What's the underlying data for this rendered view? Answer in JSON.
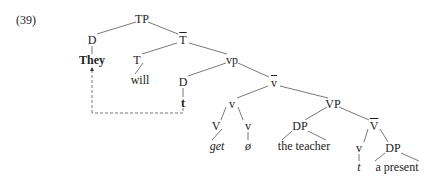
{
  "example_number": "(39)",
  "tree": {
    "nodes": [
      {
        "id": "TP",
        "label": "TP",
        "x": 142,
        "y": 19,
        "style": "normal"
      },
      {
        "id": "D1",
        "label": "D",
        "x": 92,
        "y": 40,
        "style": "normal"
      },
      {
        "id": "They",
        "label": "They",
        "x": 92,
        "y": 60,
        "style": "bold"
      },
      {
        "id": "Tbar",
        "label": "T",
        "x": 183,
        "y": 40,
        "style": "bar"
      },
      {
        "id": "T",
        "label": "T",
        "x": 137,
        "y": 60,
        "style": "normal"
      },
      {
        "id": "will",
        "label": "will",
        "x": 140,
        "y": 80,
        "style": "normal"
      },
      {
        "id": "vp",
        "label": "vp",
        "x": 232,
        "y": 60,
        "style": "normal"
      },
      {
        "id": "D2",
        "label": "D",
        "x": 183,
        "y": 82,
        "style": "normal"
      },
      {
        "id": "t1",
        "label": "t",
        "x": 183,
        "y": 103,
        "style": "bold"
      },
      {
        "id": "vbar",
        "label": "v",
        "x": 274,
        "y": 83,
        "style": "bar"
      },
      {
        "id": "v1",
        "label": "v",
        "x": 232,
        "y": 104,
        "style": "normal"
      },
      {
        "id": "V1",
        "label": "V",
        "x": 216,
        "y": 126,
        "style": "normal"
      },
      {
        "id": "get",
        "label": "get",
        "x": 217,
        "y": 146,
        "style": "italic"
      },
      {
        "id": "v2",
        "label": "v",
        "x": 248,
        "y": 126,
        "style": "normal"
      },
      {
        "id": "null",
        "label": "ø",
        "x": 248,
        "y": 146,
        "style": "italic"
      },
      {
        "id": "VP",
        "label": "VP",
        "x": 333,
        "y": 104,
        "style": "normal"
      },
      {
        "id": "DP1",
        "label": "DP",
        "x": 300,
        "y": 126,
        "style": "normal"
      },
      {
        "id": "teacher",
        "label": "the teacher",
        "x": 304,
        "y": 146,
        "style": "normal"
      },
      {
        "id": "Vbar",
        "label": "V",
        "x": 374,
        "y": 126,
        "style": "bar"
      },
      {
        "id": "v3",
        "label": "v",
        "x": 359,
        "y": 148,
        "style": "normal"
      },
      {
        "id": "t2",
        "label": "t",
        "x": 359,
        "y": 167,
        "style": "italic"
      },
      {
        "id": "DP2",
        "label": "DP",
        "x": 393,
        "y": 148,
        "style": "normal"
      },
      {
        "id": "present",
        "label": "a present",
        "x": 397,
        "y": 167,
        "style": "normal"
      }
    ],
    "edges": [
      [
        "TP",
        "D1"
      ],
      [
        "TP",
        "Tbar"
      ],
      [
        "D1",
        "They"
      ],
      [
        "Tbar",
        "T"
      ],
      [
        "Tbar",
        "vp"
      ],
      [
        "T",
        "will"
      ],
      [
        "vp",
        "D2"
      ],
      [
        "vp",
        "vbar"
      ],
      [
        "D2",
        "t1"
      ],
      [
        "vbar",
        "v1"
      ],
      [
        "vbar",
        "VP"
      ],
      [
        "v1",
        "V1"
      ],
      [
        "v1",
        "v2"
      ],
      [
        "V1",
        "get"
      ],
      [
        "v2",
        "null"
      ],
      [
        "VP",
        "DP1"
      ],
      [
        "VP",
        "Vbar"
      ],
      [
        "DP1",
        "teacher:left"
      ],
      [
        "DP1",
        "teacher:right"
      ],
      [
        "Vbar",
        "v3"
      ],
      [
        "Vbar",
        "DP2"
      ],
      [
        "v3",
        "t2"
      ],
      [
        "DP2",
        "present:left"
      ],
      [
        "DP2",
        "present:right"
      ]
    ],
    "movement_arrow": {
      "from": "t1",
      "to": "They",
      "style": "dashed"
    }
  }
}
